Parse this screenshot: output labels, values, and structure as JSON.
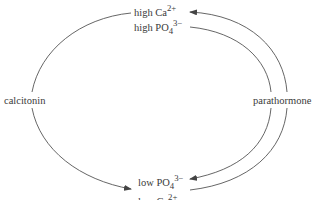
{
  "diagram": {
    "type": "cycle",
    "nodes": {
      "top": {
        "line1": {
          "base": "high Ca",
          "sup": "2+"
        },
        "line2": {
          "base": "high PO",
          "sub": "4",
          "sup": "3−"
        }
      },
      "bottom": {
        "line1": {
          "base": "low PO",
          "sub": "4",
          "sup": "3−"
        },
        "line2": {
          "base": "low Ca",
          "sup": "2+"
        }
      },
      "left": {
        "label": "calcitonin"
      },
      "right": {
        "label": "parathormone"
      }
    },
    "edges": [
      {
        "from": "top",
        "to": "bottom",
        "via": "calcitonin",
        "direction": "arrow-to-bottom"
      },
      {
        "from": "top",
        "to": "bottom",
        "via": "parathormone",
        "direction": "arrow-to-bottom",
        "path": "inner"
      },
      {
        "from": "bottom",
        "to": "top",
        "via": "parathormone",
        "direction": "arrow-to-top",
        "path": "outer"
      }
    ],
    "colors": {
      "line": "#555555",
      "text": "#3a3a3a"
    }
  }
}
